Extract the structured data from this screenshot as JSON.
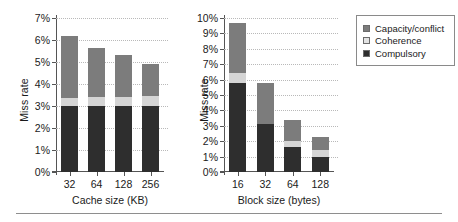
{
  "chart_data": [
    {
      "type": "bar",
      "id": "cache-size",
      "title": "",
      "xlabel": "Cache size (KB)",
      "ylabel": "Miss rate",
      "categories": [
        "32",
        "64",
        "128",
        "256"
      ],
      "ylim": [
        0,
        7
      ],
      "ytick_labels": [
        "0%",
        "1%",
        "2%",
        "3%",
        "4%",
        "5%",
        "6%",
        "7%"
      ],
      "ytick_values": [
        0,
        1,
        2,
        3,
        4,
        5,
        6,
        7
      ],
      "grid": true,
      "stacked": true,
      "series": [
        {
          "name": "Compulsory",
          "color": "#2e2e2e",
          "values": [
            3.0,
            3.0,
            3.0,
            3.0
          ]
        },
        {
          "name": "Coherence",
          "color": "#d5d5d5",
          "values": [
            0.35,
            0.4,
            0.4,
            0.45
          ]
        },
        {
          "name": "Capacity/conflict",
          "color": "#7c7c7c",
          "values": [
            2.85,
            2.25,
            1.9,
            1.45
          ]
        }
      ],
      "totals": [
        6.2,
        5.65,
        5.3,
        4.9
      ]
    },
    {
      "type": "bar",
      "id": "block-size",
      "title": "",
      "xlabel": "Block size (bytes)",
      "ylabel": "Miss rate",
      "categories": [
        "16",
        "32",
        "64",
        "128"
      ],
      "ylim": [
        0,
        10
      ],
      "ytick_labels": [
        "0%",
        "1%",
        "2%",
        "3%",
        "4%",
        "5%",
        "6%",
        "7%",
        "8%",
        "9%",
        "10%"
      ],
      "ytick_values": [
        0,
        1,
        2,
        3,
        4,
        5,
        6,
        7,
        8,
        9,
        10
      ],
      "grid": true,
      "stacked": true,
      "series": [
        {
          "name": "Compulsory",
          "color": "#2e2e2e",
          "values": [
            5.75,
            3.1,
            1.6,
            0.95
          ]
        },
        {
          "name": "Coherence",
          "color": "#d5d5d5",
          "values": [
            0.65,
            0.0,
            0.4,
            0.45
          ]
        },
        {
          "name": "Capacity/conflict",
          "color": "#7c7c7c",
          "values": [
            3.25,
            2.7,
            1.4,
            0.85
          ]
        }
      ],
      "totals": [
        9.65,
        5.8,
        3.4,
        2.25
      ]
    }
  ],
  "legend": {
    "position": "right",
    "items": [
      {
        "label": "Capacity/conflict",
        "color": "#7c7c7c"
      },
      {
        "label": "Coherence",
        "color": "#e3e3e3"
      },
      {
        "label": "Compulsory",
        "color": "#2e2e2e"
      }
    ]
  }
}
